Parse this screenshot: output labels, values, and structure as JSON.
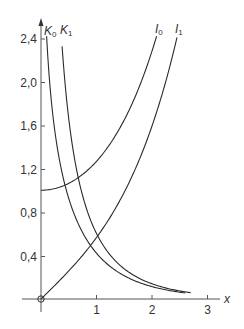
{
  "chart_data": {
    "type": "line",
    "title": "",
    "xlabel": "x",
    "ylabel": "",
    "xlim": [
      0,
      3
    ],
    "ylim": [
      0,
      2.4
    ],
    "x_ticks": [
      "1",
      "2",
      "3"
    ],
    "y_ticks": [
      "0,4",
      "0,8",
      "1,2",
      "1,6",
      "2,0",
      "2,4"
    ],
    "grid": false,
    "legend": "inline labels at top of curves",
    "series": [
      {
        "name": "I0",
        "label_main": "I",
        "label_sub": "0",
        "description": "Modified Bessel function of the first kind, order 0",
        "x": [
          0,
          0.5,
          1.0,
          1.5,
          2.0,
          2.2
        ],
        "y": [
          1.0,
          1.06,
          1.27,
          1.65,
          2.28,
          2.63
        ]
      },
      {
        "name": "I1",
        "label_main": "I",
        "label_sub": "1",
        "description": "Modified Bessel function of the first kind, order 1",
        "x": [
          0,
          0.5,
          1.0,
          1.5,
          2.0,
          2.5,
          2.7
        ],
        "y": [
          0.0,
          0.26,
          0.57,
          0.98,
          1.59,
          2.52,
          3.01
        ]
      },
      {
        "name": "K0",
        "label_main": "K",
        "label_sub": "0",
        "description": "Modified Bessel function of the second kind, order 0",
        "x": [
          0.06,
          0.1,
          0.2,
          0.5,
          1.0,
          1.5,
          2.0,
          2.5
        ],
        "y": [
          2.92,
          2.43,
          1.75,
          0.92,
          0.42,
          0.21,
          0.11,
          0.06
        ]
      },
      {
        "name": "K1",
        "label_main": "K",
        "label_sub": "1",
        "description": "Modified Bessel function of the second kind, order 1",
        "x": [
          0.35,
          0.5,
          1.0,
          1.5,
          2.0,
          2.5,
          2.7
        ],
        "y": [
          2.56,
          1.66,
          0.6,
          0.28,
          0.14,
          0.07,
          0.06
        ]
      }
    ],
    "annotations": [
      "open circle at origin"
    ]
  },
  "axes": {
    "x_label": "x",
    "origin_marker": "circle"
  },
  "colors": {
    "line": "#2b2b2b",
    "axis": "#555555",
    "text": "#333333"
  }
}
